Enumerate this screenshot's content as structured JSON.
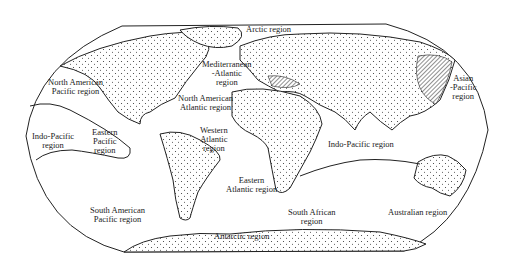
{
  "map": {
    "title": "Marine biogeographic regions of the world",
    "regions": [
      {
        "id": "arctic",
        "label": "Arctic region"
      },
      {
        "id": "mediterranean-atlantic",
        "label_line1": "Mediterranean",
        "label_line2": "-Atlantic",
        "label_line3": "region"
      },
      {
        "id": "asian-pacific",
        "label_line1": "Asian",
        "label_line2": "-Pacific",
        "label_line3": "region"
      },
      {
        "id": "north-american-pacific",
        "label_line1": "North American",
        "label_line2": "Pacific region"
      },
      {
        "id": "north-american-atlantic",
        "label_line1": "North American",
        "label_line2": "Atlantic region"
      },
      {
        "id": "indo-pacific-west",
        "label_line1": "Indo-Pacific",
        "label_line2": "region"
      },
      {
        "id": "eastern-pacific",
        "label_line1": "Eastern",
        "label_line2": "Pacific",
        "label_line3": "region"
      },
      {
        "id": "western-atlantic",
        "label_line1": "Western",
        "label_line2": "Atlantic",
        "label_line3": "region"
      },
      {
        "id": "indo-pacific-east",
        "label": "Indo-Pacific region"
      },
      {
        "id": "eastern-atlantic",
        "label_line1": "Eastern",
        "label_line2": "Atlantic region"
      },
      {
        "id": "south-american-pacific",
        "label_line1": "South American",
        "label_line2": "Pacific region"
      },
      {
        "id": "south-african",
        "label_line1": "South African",
        "label_line2": "region"
      },
      {
        "id": "australian",
        "label": "Australian region"
      },
      {
        "id": "antarctic",
        "label": "Antarctic region"
      }
    ]
  }
}
